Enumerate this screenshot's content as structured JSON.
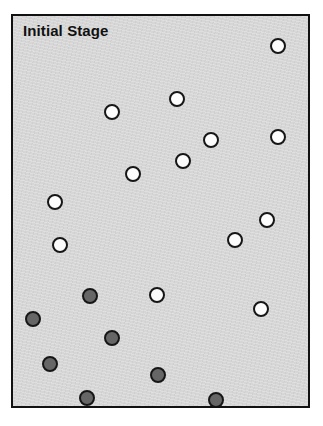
{
  "figure": {
    "background_color": "#ffffff",
    "panel": {
      "title": "Initial Stage",
      "background_color": "#d6d6d6",
      "border_color": "#111111",
      "x": 11,
      "y": 14,
      "width": 299,
      "height": 394
    },
    "legend_colors": {
      "open_node_fill": "#fcfcfc",
      "filled_node_fill": "#666666",
      "node_outline": "#161616"
    },
    "counts": {
      "open_nodes": 15,
      "filled_nodes": 7,
      "total_nodes": 22
    }
  },
  "chart_data": {
    "type": "scatter",
    "title": "Initial Stage",
    "xlabel": "",
    "ylabel": "",
    "grid": false,
    "legend_position": "none",
    "xlim": [
      0,
      299
    ],
    "ylim": [
      0,
      394
    ],
    "note": "Coordinates are in panel-local pixels measured from the panel's inner top-left corner; y increases downward.",
    "series": [
      {
        "name": "open",
        "marker": "circle-open",
        "fill": "#fcfcfc",
        "outline": "#161616",
        "radius": 8,
        "points": [
          {
            "x": 265,
            "y": 30
          },
          {
            "x": 164,
            "y": 83
          },
          {
            "x": 99,
            "y": 96
          },
          {
            "x": 265,
            "y": 121
          },
          {
            "x": 198,
            "y": 124
          },
          {
            "x": 170,
            "y": 145
          },
          {
            "x": 120,
            "y": 158
          },
          {
            "x": 42,
            "y": 186
          },
          {
            "x": 254,
            "y": 204
          },
          {
            "x": 47,
            "y": 229
          },
          {
            "x": 222,
            "y": 224
          },
          {
            "x": 144,
            "y": 279
          },
          {
            "x": 248,
            "y": 293
          }
        ]
      },
      {
        "name": "filled",
        "marker": "circle-filled",
        "fill": "#666666",
        "outline": "#161616",
        "radius": 8,
        "points": [
          {
            "x": 77,
            "y": 280
          },
          {
            "x": 20,
            "y": 303
          },
          {
            "x": 99,
            "y": 322
          },
          {
            "x": 37,
            "y": 348
          },
          {
            "x": 145,
            "y": 359
          },
          {
            "x": 74,
            "y": 382
          },
          {
            "x": 203,
            "y": 384
          }
        ]
      }
    ]
  }
}
